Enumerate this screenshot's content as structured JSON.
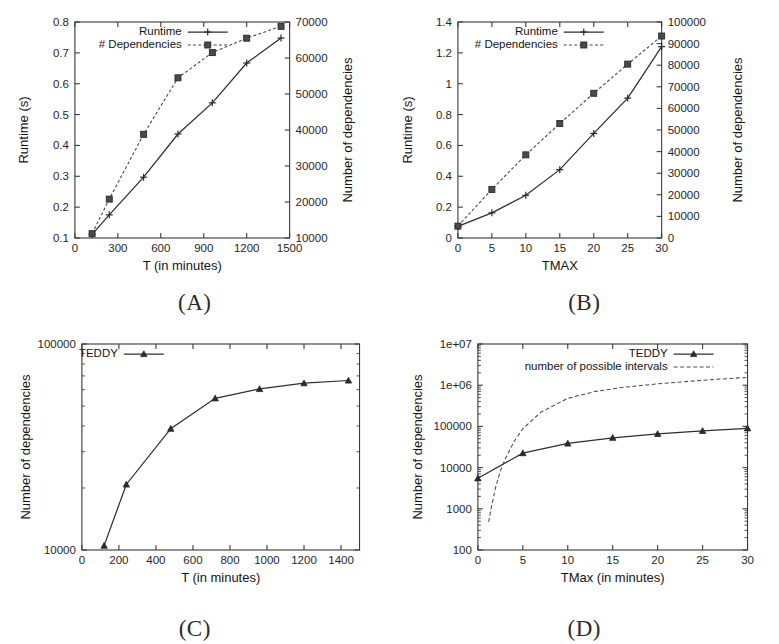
{
  "figure": {
    "panels": [
      {
        "id": "A",
        "caption": "(A)"
      },
      {
        "id": "B",
        "caption": "(B)"
      },
      {
        "id": "C",
        "caption": "(C)"
      },
      {
        "id": "D",
        "caption": "(D)"
      }
    ]
  },
  "chart_data": [
    {
      "panel": "A",
      "type": "line",
      "title": "",
      "xlabel": "T (in minutes)",
      "ylabel": "Runtime (s)",
      "y2label": "Number of dependencies",
      "xlim": [
        0,
        1500
      ],
      "ylim": [
        0.1,
        0.8
      ],
      "y2lim": [
        10000,
        70000
      ],
      "xticks": [
        0,
        300,
        600,
        900,
        1200,
        1500
      ],
      "xticklabels": [
        "0",
        "300",
        "600",
        "900",
        "1200",
        "1500"
      ],
      "yticks": [
        0.1,
        0.2,
        0.3,
        0.4,
        0.5,
        0.6,
        0.7,
        0.8
      ],
      "yticklabels": [
        "0.1",
        "0.2",
        "0.3",
        "0.4",
        "0.5",
        "0.6",
        "0.7",
        "0.8"
      ],
      "y2ticks": [
        10000,
        20000,
        30000,
        40000,
        50000,
        60000,
        70000
      ],
      "y2ticklabels": [
        "10000",
        "20000",
        "30000",
        "40000",
        "50000",
        "60000",
        "70000"
      ],
      "grid": false,
      "legend_position": "top-center",
      "series": [
        {
          "name": "Runtime",
          "axis": "left",
          "style": "solid",
          "marker": "plus",
          "x": [
            120,
            240,
            480,
            720,
            960,
            1200,
            1440
          ],
          "values": [
            0.112,
            0.175,
            0.297,
            0.437,
            0.538,
            0.667,
            0.748
          ]
        },
        {
          "name": "# Dependencies",
          "axis": "right",
          "style": "dotted",
          "marker": "square",
          "x": [
            120,
            240,
            480,
            720,
            960,
            1200,
            1440
          ],
          "values": [
            11200,
            20800,
            38800,
            54500,
            61500,
            65500,
            68800
          ]
        }
      ]
    },
    {
      "panel": "B",
      "type": "line",
      "title": "",
      "xlabel": "TMAX",
      "ylabel": "Runtime (s)",
      "y2label": "Number of dependencies",
      "xlim": [
        0,
        30
      ],
      "ylim": [
        0,
        1.4
      ],
      "y2lim": [
        0,
        100000
      ],
      "xticks": [
        0,
        5,
        10,
        15,
        20,
        25,
        30
      ],
      "xticklabels": [
        "0",
        "5",
        "10",
        "15",
        "20",
        "25",
        "30"
      ],
      "yticks": [
        0,
        0.2,
        0.4,
        0.6,
        0.8,
        1,
        1.2,
        1.4
      ],
      "yticklabels": [
        "0",
        "0.2",
        "0.4",
        "0.6",
        "0.8",
        "1",
        "1.2",
        "1.4"
      ],
      "y2ticks": [
        0,
        10000,
        20000,
        30000,
        40000,
        50000,
        60000,
        70000,
        80000,
        90000,
        100000
      ],
      "y2ticklabels": [
        "0",
        "10000",
        "20000",
        "30000",
        "40000",
        "50000",
        "60000",
        "70000",
        "80000",
        "90000",
        "100000"
      ],
      "grid": false,
      "legend_position": "top-center",
      "series": [
        {
          "name": "Runtime",
          "axis": "left",
          "style": "solid",
          "marker": "plus",
          "x": [
            0,
            5,
            10,
            15,
            20,
            25,
            30
          ],
          "values": [
            0.075,
            0.163,
            0.277,
            0.443,
            0.678,
            0.907,
            1.24
          ]
        },
        {
          "name": "# Dependencies",
          "axis": "right",
          "style": "dotted",
          "marker": "square",
          "x": [
            0,
            5,
            10,
            15,
            20,
            25,
            30
          ],
          "values": [
            5500,
            22500,
            38500,
            53000,
            67000,
            80500,
            93500
          ]
        }
      ]
    },
    {
      "panel": "C",
      "type": "line",
      "title": "",
      "xlabel": "T (in minutes)",
      "ylabel": "Number of dependencies",
      "xlim": [
        0,
        1500
      ],
      "ylim": [
        10000,
        100000
      ],
      "yscale": "log",
      "xticks": [
        0,
        200,
        400,
        600,
        800,
        1000,
        1200,
        1400
      ],
      "xticklabels": [
        "0",
        "200",
        "400",
        "600",
        "800",
        "1000",
        "1200",
        "1400"
      ],
      "yticks": [
        10000,
        100000
      ],
      "yticklabels": [
        "10000",
        "100000"
      ],
      "grid": false,
      "legend_position": "top-left",
      "series": [
        {
          "name": "TEDDY",
          "axis": "left",
          "style": "solid",
          "marker": "tri",
          "x": [
            120,
            240,
            480,
            720,
            960,
            1200,
            1440
          ],
          "values": [
            10500,
            20800,
            38800,
            54500,
            60500,
            64500,
            66500
          ]
        }
      ]
    },
    {
      "panel": "D",
      "type": "line",
      "title": "",
      "xlabel": "TMax (in minutes)",
      "ylabel": "Number of dependencies",
      "xlim": [
        0,
        30
      ],
      "ylim": [
        100,
        10000000
      ],
      "yscale": "log",
      "xticks": [
        0,
        5,
        10,
        15,
        20,
        25,
        30
      ],
      "xticklabels": [
        "0",
        "5",
        "10",
        "15",
        "20",
        "25",
        "30"
      ],
      "yticks": [
        100,
        1000,
        10000,
        100000,
        1000000,
        10000000
      ],
      "yticklabels": [
        "100",
        "1000",
        "10000",
        "100000",
        "1e+06",
        "1e+07"
      ],
      "grid": false,
      "legend_position": "top-right",
      "series": [
        {
          "name": "TEDDY",
          "axis": "left",
          "style": "solid",
          "marker": "tri",
          "x": [
            0,
            5,
            10,
            15,
            20,
            25,
            30
          ],
          "values": [
            5500,
            22500,
            38500,
            53000,
            66000,
            78000,
            90000
          ]
        },
        {
          "name": "number of possible intervals",
          "axis": "left",
          "style": "dashed",
          "marker": "none",
          "x": [
            1.2,
            1.5,
            2,
            2.5,
            3,
            4,
            5,
            7,
            10,
            13,
            16,
            20,
            25,
            30
          ],
          "values": [
            480,
            1100,
            3500,
            8200,
            15500,
            42000,
            88000,
            220000,
            480000,
            700000,
            880000,
            1080000,
            1320000,
            1550000
          ]
        }
      ]
    }
  ]
}
